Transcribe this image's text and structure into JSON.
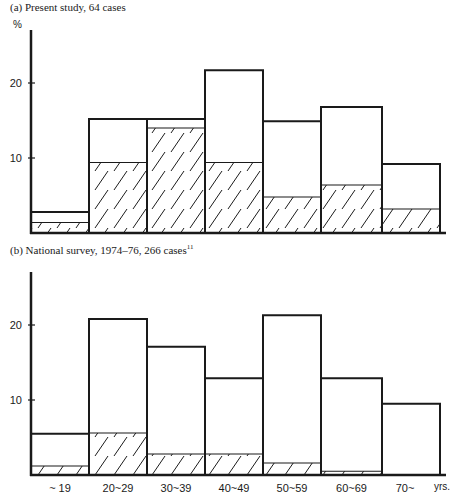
{
  "chart_data": [
    {
      "type": "bar",
      "title": "(a) Present study, 64 cases",
      "ylabel": "%",
      "xlabel": "yrs.",
      "ylim": [
        0,
        25
      ],
      "yticks": [
        10,
        20
      ],
      "categories": [
        "~ 19",
        "20~29",
        "30~39",
        "40~49",
        "50~59",
        "60~69",
        "70~"
      ],
      "series": [
        {
          "name": "total",
          "style": "outline",
          "values": [
            2.8,
            15.2,
            15.2,
            21.7,
            14.9,
            16.8,
            9.2
          ]
        },
        {
          "name": "hatched subset",
          "style": "hatched",
          "values": [
            1.4,
            9.4,
            14.0,
            9.4,
            4.8,
            6.4,
            3.2
          ]
        }
      ],
      "grid": false,
      "legend": null
    },
    {
      "type": "bar",
      "title": "(b) National survey, 1974–76, 266 cases",
      "title_superscript": "11",
      "ylabel": "",
      "xlabel": "yrs.",
      "ylim": [
        0,
        25
      ],
      "yticks": [
        10,
        20
      ],
      "categories": [
        "~ 19",
        "20~29",
        "30~39",
        "40~49",
        "50~59",
        "60~69",
        "70~"
      ],
      "series": [
        {
          "name": "total",
          "style": "outline",
          "values": [
            5.5,
            20.8,
            17.1,
            12.9,
            21.3,
            12.9,
            9.5
          ]
        },
        {
          "name": "hatched subset",
          "style": "hatched",
          "values": [
            1.2,
            5.6,
            2.8,
            2.8,
            1.6,
            0.5,
            0
          ]
        }
      ],
      "grid": false,
      "legend": null
    }
  ],
  "captions": {
    "a": "(a) Present study, 64 cases",
    "b_main": "(b) National survey, 1974–76, 266 cases",
    "b_sup": "11"
  },
  "axis": {
    "percent": "%",
    "years": "yrs.",
    "tick_10": "10",
    "tick_20": "20"
  }
}
